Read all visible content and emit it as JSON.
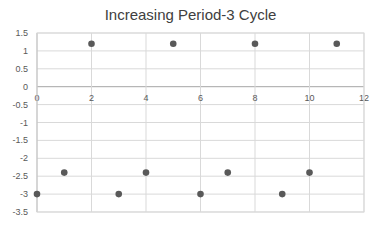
{
  "chart_data": {
    "type": "scatter",
    "title": "Increasing Period-3 Cycle",
    "xlabel": "",
    "ylabel": "",
    "xlim": [
      0,
      12
    ],
    "ylim": [
      -3.5,
      1.5
    ],
    "xticks": [
      0,
      2,
      4,
      6,
      8,
      10,
      12
    ],
    "yticks": [
      1.5,
      1,
      0.5,
      0,
      -0.5,
      -1,
      -1.5,
      -2,
      -2.5,
      -3,
      -3.5
    ],
    "grid": true,
    "legend": null,
    "marker_color": "#595959",
    "series": [
      {
        "name": "Series1",
        "x": [
          0,
          1,
          2,
          3,
          4,
          5,
          6,
          7,
          8,
          9,
          10,
          11
        ],
        "y": [
          -3,
          -2.4,
          1.2,
          -3,
          -2.4,
          1.2,
          -3,
          -2.4,
          1.2,
          -3,
          -2.4,
          1.2
        ]
      }
    ]
  }
}
